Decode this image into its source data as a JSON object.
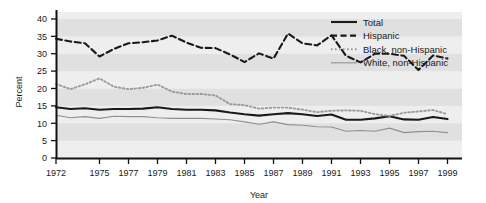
{
  "chart_data": {
    "type": "line",
    "title": "",
    "xlabel": "Year",
    "ylabel": "Percent",
    "xlim": [
      1972,
      2000
    ],
    "ylim": [
      0,
      42
    ],
    "yticks": [
      0,
      5,
      10,
      15,
      20,
      25,
      30,
      35,
      40
    ],
    "xticks": [
      1972,
      1975,
      1977,
      1979,
      1981,
      1983,
      1985,
      1987,
      1989,
      1991,
      1993,
      1995,
      1997,
      1999
    ],
    "xtick_labels": [
      "1972",
      "1975",
      "1977",
      "1979",
      "1981",
      "1983",
      "1985",
      "1987",
      "1989",
      "1991",
      "1993",
      "1995",
      "1997",
      "1999"
    ],
    "ytick_labels": [
      "0",
      "5",
      "10",
      "15",
      "20",
      "25",
      "30",
      "35",
      "40"
    ],
    "grid": "horizontal-bands",
    "legend_position": "top-right",
    "x": [
      1972,
      1973,
      1974,
      1975,
      1976,
      1977,
      1978,
      1979,
      1980,
      1981,
      1982,
      1983,
      1984,
      1985,
      1986,
      1987,
      1988,
      1989,
      1990,
      1991,
      1992,
      1993,
      1994,
      1995,
      1996,
      1997,
      1998,
      1999
    ],
    "series": [
      {
        "name": "Total",
        "style": "solid-thick",
        "color": "#1a1a1a",
        "values": [
          14.6,
          14.1,
          14.3,
          13.9,
          14.1,
          14.1,
          14.2,
          14.6,
          14.1,
          13.9,
          13.9,
          13.7,
          13.1,
          12.6,
          12.2,
          12.6,
          12.9,
          12.6,
          12.1,
          12.5,
          11.0,
          11.0,
          11.4,
          12.0,
          11.1,
          11.0,
          11.8,
          11.2
        ]
      },
      {
        "name": "Hispanic",
        "style": "dashed",
        "color": "#1a1a1a",
        "values": [
          34.3,
          33.5,
          33.0,
          29.2,
          31.4,
          33.0,
          33.3,
          33.8,
          35.2,
          33.2,
          31.7,
          31.6,
          29.8,
          27.6,
          30.1,
          28.6,
          35.8,
          33.0,
          32.4,
          35.3,
          29.4,
          27.5,
          30.0,
          30.0,
          29.4,
          25.3,
          29.5,
          28.6
        ]
      },
      {
        "name": "Black, non-Hispanic",
        "style": "dotted",
        "color": "#9a9a9a",
        "values": [
          21.3,
          19.8,
          21.2,
          22.9,
          20.5,
          19.8,
          20.2,
          21.1,
          19.1,
          18.4,
          18.4,
          18.0,
          15.5,
          15.2,
          14.2,
          14.5,
          14.5,
          13.9,
          13.2,
          13.6,
          13.7,
          13.6,
          12.6,
          12.1,
          13.0,
          13.4,
          13.8,
          12.6
        ]
      },
      {
        "name": "White, non-Hispanic",
        "style": "solid-thin",
        "color": "#8f8f8f",
        "values": [
          12.3,
          11.6,
          11.9,
          11.4,
          12.0,
          11.9,
          11.9,
          11.6,
          11.4,
          11.4,
          11.4,
          11.2,
          11.0,
          10.4,
          9.7,
          10.4,
          9.6,
          9.4,
          9.0,
          8.9,
          7.7,
          7.9,
          7.7,
          8.6,
          7.3,
          7.6,
          7.7,
          7.3
        ]
      }
    ]
  },
  "legend": {
    "items": [
      {
        "label": "Total",
        "style": "solid-thick"
      },
      {
        "label": "Hispanic",
        "style": "dashed"
      },
      {
        "label": "Black, non-Hispanic",
        "style": "dotted"
      },
      {
        "label": "White, non-Hispanic",
        "style": "solid-thin"
      }
    ]
  },
  "colors": {
    "total": "#1a1a1a",
    "hispanic": "#1a1a1a",
    "black_non_hispanic": "#9a9a9a",
    "white_non_hispanic": "#8f8f8f",
    "band_light": "#eeeeee",
    "band_dark": "#e0e0e0",
    "axis": "#111111",
    "page_background": "#ffffff"
  }
}
